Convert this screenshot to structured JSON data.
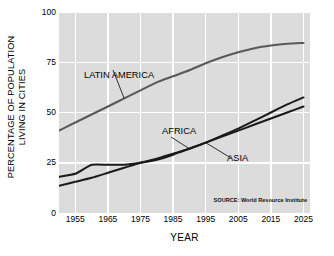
{
  "chart_data": {
    "type": "line",
    "title": "",
    "subtitle": "",
    "xlabel": "YEAR",
    "ylabel_line1": "PERCENTAGE OF POPULATION",
    "ylabel_line2": "LIVING IN CITIES",
    "xlim": [
      1950,
      2027
    ],
    "ylim": [
      0,
      100
    ],
    "xticks": [
      "1955",
      "1965",
      "1975",
      "1985",
      "1995",
      "2005",
      "2015",
      "2025"
    ],
    "xtick_values": [
      1955,
      1965,
      1975,
      1985,
      1995,
      2005,
      2015,
      2025
    ],
    "yticks": [
      "0",
      "25",
      "50",
      "75",
      "100"
    ],
    "ytick_values": [
      0,
      25,
      50,
      75,
      100
    ],
    "grid": true,
    "grid_color": "#ffffff",
    "plot_background": "#dcdcdc",
    "figure_background": "#ffffff",
    "legend": "inline-annotations",
    "annotation": "SOURCE: World Resource Institute",
    "series": [
      {
        "name": "LATIN AMERICA",
        "color": "#595959",
        "label_position": "upper-left",
        "x": [
          1950,
          1955,
          1960,
          1965,
          1970,
          1975,
          1980,
          1985,
          1990,
          1995,
          2000,
          2005,
          2010,
          2015,
          2020,
          2025
        ],
        "values": [
          41,
          45,
          49,
          53,
          57,
          61,
          65,
          68,
          71,
          74.5,
          77.5,
          80,
          82,
          83.3,
          84.2,
          84.6
        ]
      },
      {
        "name": "AFRICA",
        "color": "#1a1a1a",
        "label_position": "middle",
        "x": [
          1950,
          1955,
          1960,
          1965,
          1970,
          1975,
          1980,
          1985,
          1990,
          1995,
          2000,
          2005,
          2010,
          2015,
          2020,
          2025
        ],
        "values": [
          18,
          19.5,
          24,
          24,
          24,
          25,
          26.5,
          29,
          32,
          35,
          38.5,
          42,
          46,
          50,
          54,
          57.5
        ]
      },
      {
        "name": "ASIA",
        "color": "#1a1a1a",
        "label_position": "lower-right",
        "x": [
          1950,
          1955,
          1960,
          1965,
          1970,
          1975,
          1980,
          1985,
          1990,
          1995,
          2000,
          2005,
          2010,
          2015,
          2020,
          2025
        ],
        "values": [
          13.5,
          15.5,
          17.5,
          20,
          22.5,
          25,
          27,
          29.5,
          32,
          35,
          38,
          41,
          44,
          47,
          50,
          53
        ]
      }
    ]
  }
}
